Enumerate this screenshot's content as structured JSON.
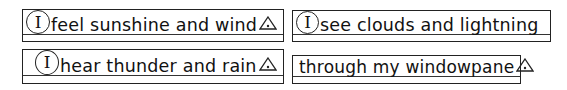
{
  "worksheet": {
    "strips": [
      {
        "pronoun": "I",
        "text": "feel sunshine and wind",
        "end_mark": "triangle-with-dot"
      },
      {
        "pronoun": "I",
        "text": "see clouds and lightning",
        "end_mark": null
      },
      {
        "pronoun": "I",
        "text": "hear thunder and rain",
        "end_mark": "triangle-with-dot"
      },
      {
        "pronoun": null,
        "text": "through my windowpane",
        "end_mark": "triangle-with-dot"
      }
    ],
    "colors": {
      "ink": "#222222",
      "background": "#ffffff"
    }
  }
}
